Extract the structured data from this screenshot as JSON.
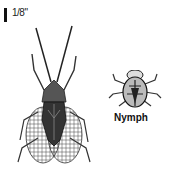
{
  "scale": {
    "label": "1/8\""
  },
  "figures": [
    {
      "name": "adult",
      "label": ""
    },
    {
      "name": "nymph",
      "label": "Nymph"
    }
  ]
}
